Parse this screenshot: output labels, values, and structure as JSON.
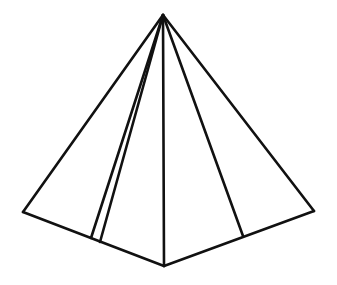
{
  "figure": {
    "stroke_color": "#111111",
    "background": "#ffffff",
    "vertices": {
      "apex": [
        163,
        15
      ],
      "left": [
        23,
        212
      ],
      "bottom": [
        164,
        266
      ],
      "right": [
        314,
        211
      ],
      "inner_a": [
        91,
        238
      ],
      "inner_b": [
        100,
        242
      ],
      "inner_c": [
        243,
        236
      ]
    },
    "edges": [
      {
        "name": "edge-apex-left",
        "from": "apex",
        "to": "left"
      },
      {
        "name": "edge-apex-right",
        "from": "apex",
        "to": "right"
      },
      {
        "name": "edge-apex-bottom",
        "from": "apex",
        "to": "bottom"
      },
      {
        "name": "edge-apex-inner-a",
        "from": "apex",
        "to": "inner_a"
      },
      {
        "name": "edge-apex-inner-b",
        "from": "apex",
        "to": "inner_b"
      },
      {
        "name": "edge-apex-inner-c",
        "from": "apex",
        "to": "inner_c"
      },
      {
        "name": "edge-left-bottom",
        "from": "left",
        "to": "bottom"
      },
      {
        "name": "edge-bottom-right",
        "from": "bottom",
        "to": "right"
      }
    ]
  }
}
